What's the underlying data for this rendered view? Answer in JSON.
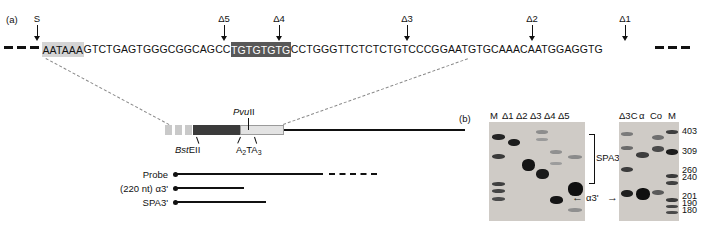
{
  "figure": {
    "panel_a_label": "(a)",
    "panel_b_label": "(b)"
  },
  "panel_a": {
    "arrows": [
      {
        "label": "S",
        "x": 37
      },
      {
        "label": "Δ5",
        "x": 224
      },
      {
        "label": "Δ4",
        "x": 279
      },
      {
        "label": "Δ3",
        "x": 407
      },
      {
        "label": "Δ2",
        "x": 532
      },
      {
        "label": "Δ1",
        "x": 625
      }
    ],
    "sequence": {
      "segment_1_plain": "",
      "polyA_signal": "AATAAA",
      "segment_2": "GTCTGAGTGGGCGGCAGCC",
      "gt_rich": "TGTGTGTG",
      "segment_3": "CCTGGGTTCTCTCTGTCCCGGAATGTGCAAACAATGGAGGTG",
      "full": "AATAAAGTCTGAGTGGGCGGCAGCCTGTGTGTGCCTGGGTTCTCTCTGTCCCGGAATGTGCAAACAATGGAGGTG"
    }
  },
  "gene_map": {
    "pvuII_label_italic": "Pvu",
    "pvuII_label_rest": "II",
    "bstEII_label_italic": "Bst",
    "bstEII_label_rest": "EII",
    "aTa_prefix": "A",
    "aTa_sub1": "2",
    "aTa_mid": "TA",
    "aTa_sub2": "3"
  },
  "tracks": [
    {
      "label": "Probe"
    },
    {
      "label": "(220 nt) α3'"
    },
    {
      "label": "SPA3'"
    }
  ],
  "panel_b": {
    "lanes_left": [
      "M",
      "Δ1",
      "Δ2",
      "Δ3",
      "Δ4",
      "Δ5"
    ],
    "lanes_right": [
      "Δ3C",
      "α",
      "Co",
      "M"
    ],
    "markers": [
      "403",
      "309",
      "260",
      "240",
      "201",
      "190",
      "180"
    ],
    "annotations": {
      "spa3_label": "SPA3'",
      "alpha3_label": "α3'",
      "arrow_left": "←",
      "arrow_right": "→"
    }
  }
}
